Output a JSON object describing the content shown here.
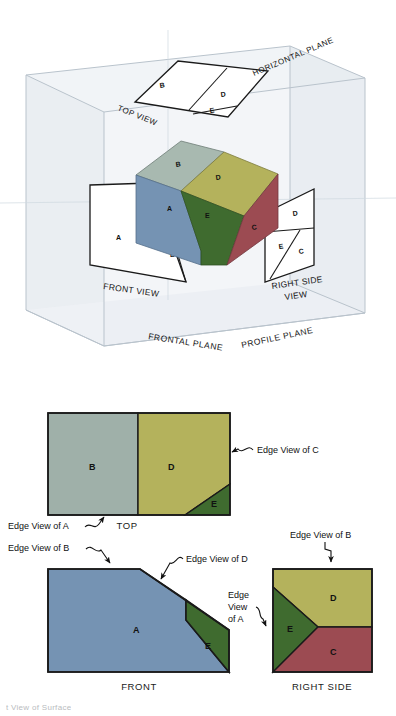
{
  "figure": {
    "title_cut_off": "t View of Surface",
    "pictorial": {
      "plane_labels": {
        "horizontal": "HORIZONTAL PLANE",
        "frontal": "FRONTAL PLANE",
        "profile": "PROFILE PLANE"
      },
      "view_labels": {
        "top": "TOP VIEW",
        "front": "FRONT VIEW",
        "right_side_line1": "RIGHT SIDE",
        "right_side_line2": "VIEW"
      },
      "solid_face_letters": [
        "A",
        "B",
        "C",
        "D",
        "E"
      ],
      "top_panel_letters": [
        "B",
        "D",
        "E"
      ],
      "front_panel_letters": [
        "A",
        "E"
      ],
      "right_panel_letters": [
        "D",
        "E",
        "C"
      ]
    },
    "ortho": {
      "top_view": {
        "caption": "TOP",
        "face_letters": [
          "B",
          "D",
          "E"
        ],
        "annotations": [
          "Edge View of A",
          "Edge View of C"
        ]
      },
      "front_view": {
        "caption": "FRONT",
        "face_letters": [
          "A",
          "E"
        ],
        "annotations": [
          "Edge View of B",
          "Edge View of D"
        ]
      },
      "right_side_view": {
        "caption": "RIGHT SIDE",
        "face_letters": [
          "D",
          "E",
          "C"
        ],
        "annotations": [
          "Edge View of B",
          "Edge View of A"
        ],
        "edge_view_of_a_lines": [
          "Edge",
          "View",
          "of A"
        ]
      }
    },
    "colors": {
      "face_a_blue": "#7593b3",
      "face_b_graygreen": "#9fb0a9",
      "face_c_red": "#9c4b52",
      "face_d_olive": "#b4b25c",
      "face_e_green": "#3f6b2f",
      "face_b_top_3d": "#a8b9b0",
      "outline": "#1a1a1a",
      "glass_box": "#e9edf1",
      "glass_box_edge": "#c3ccd4",
      "panel_white": "#ffffff"
    }
  }
}
